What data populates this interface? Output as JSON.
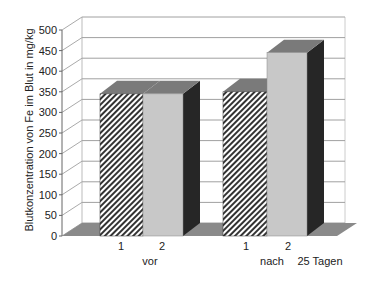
{
  "chart_data": {
    "type": "bar",
    "style": "3d-clustered-column",
    "title": "",
    "ylabel": "Blutkonzentration von Fe im Blut in mg/kg",
    "xlabel": "",
    "ylim": [
      0,
      500
    ],
    "yticks": [
      0,
      50,
      100,
      150,
      200,
      250,
      300,
      350,
      400,
      450,
      500
    ],
    "grid": true,
    "groups": [
      {
        "label": "vor",
        "bars": [
          {
            "label": "1",
            "value": 345,
            "pattern": "hatched"
          },
          {
            "label": "2",
            "value": 345,
            "pattern": "light-gray"
          }
        ]
      },
      {
        "label": "nach 25 Tagen",
        "bars": [
          {
            "label": "1",
            "value": 350,
            "pattern": "hatched"
          },
          {
            "label": "2",
            "value": 445,
            "pattern": "light-gray"
          }
        ]
      }
    ],
    "categories": [
      "vor",
      "nach 25 Tagen"
    ],
    "series": [
      {
        "name": "1",
        "values": [
          345,
          350
        ]
      },
      {
        "name": "2",
        "values": [
          345,
          445
        ]
      }
    ],
    "group_labels": [
      "vor",
      "nach",
      "25 Tagen"
    ],
    "legend": "none"
  },
  "colors": {
    "hatch_fg": "#333333",
    "hatch_bg": "#ffffff",
    "light_bar": "#c8c8c8",
    "side_dark": "#262626",
    "top": "#7a7a7a",
    "floor": "#8a8a8a",
    "grid": "#a0a0a0"
  }
}
